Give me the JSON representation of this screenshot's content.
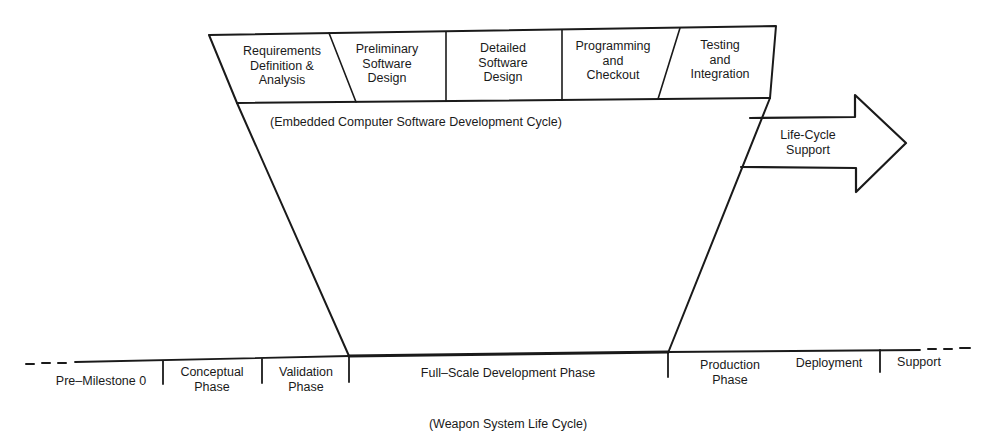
{
  "software_cycle": {
    "title": "(Embedded Computer Software Development Cycle)",
    "phases": [
      {
        "label": "Requirements\nDefinition &\nAnalysis"
      },
      {
        "label": "Preliminary\nSoftware\nDesign"
      },
      {
        "label": "Detailed\nSoftware\nDesign"
      },
      {
        "label": "Programming\nand\nCheckout"
      },
      {
        "label": "Testing\nand\nIntegration"
      }
    ]
  },
  "arrow": {
    "label": "Life-Cycle\nSupport"
  },
  "weapon_system": {
    "title": "(Weapon System Life Cycle)",
    "phases": [
      {
        "label": "Pre–Milestone 0"
      },
      {
        "label": "Conceptual\nPhase"
      },
      {
        "label": "Validation\nPhase"
      },
      {
        "label": "Full–Scale Development Phase"
      },
      {
        "label": "Production\nPhase"
      },
      {
        "label": "Deployment"
      },
      {
        "label": "Support"
      }
    ]
  },
  "colors": {
    "ink": "#1a1a1a",
    "paper": "#ffffff"
  }
}
